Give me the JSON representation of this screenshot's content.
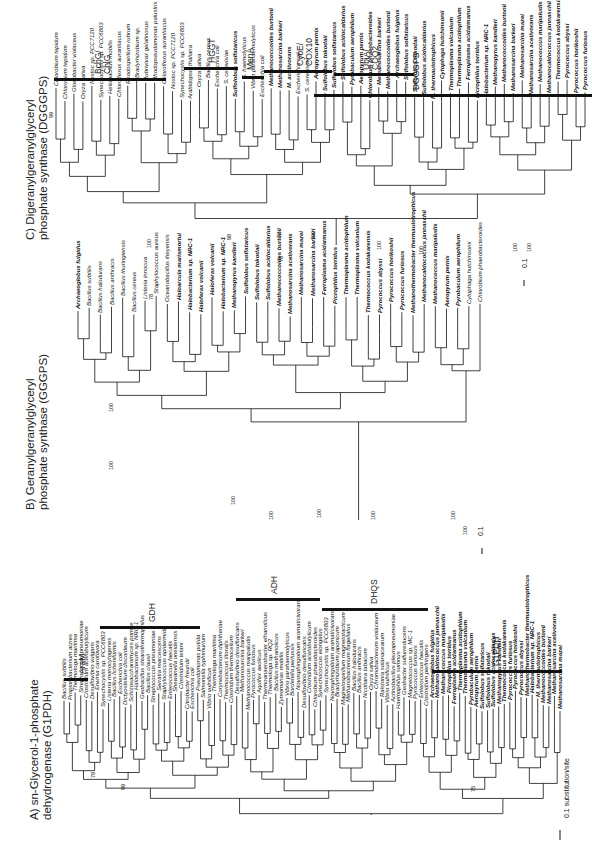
{
  "panels": {
    "a": {
      "title_line1": "A) sn-Glycerol-1-phosphate",
      "title_line2": "dehydrogenase (G1PDH)",
      "groups": [
        "AraM",
        "GDH",
        "ADH",
        "DHQS",
        "G1PDH"
      ],
      "scale": "0.1 substitution/site",
      "bootstrap": [
        "78",
        "99",
        "75"
      ],
      "taxa_arar": [
        "Bacillus subtilis",
        "Propionibacterium acnes",
        "Thermotoga maritima",
        "Streptococcus pneumoniae",
        "Clostridium acetobutylicum",
        "Desulfovibrio vulgaris"
      ],
      "taxa_gdh": [
        "Erwinia carotovora",
        "Synechocystis sp. PCC6803",
        "Listeria monocytogenes",
        "Bacillus licheniformis",
        "Escherichia coli",
        "Dictyostelium discoideum",
        "Schizosaccharomyces pombe",
        "Halobacterium sp. NRC-1",
        "Geobacillus stearothermophilus",
        "Bacillus clausii",
        "Streptococcus pneumoniae",
        "Serratia marcescens",
        "Staphylococcus epidermidis",
        "Enterococcus faecalis",
        "Shewanella oneidensis",
        "Clostridium tetani",
        "Citrobacter freundii",
        "Escherichia coli",
        "Pseudomonas putida",
        "Salmonella typhimurium",
        "Vibrio vulnificus"
      ],
      "taxa_adh": [
        "Thermotoga maritima",
        "Corynebacterium diphtheriae",
        "Thermococcus litoralis",
        "Clostridium thermocellum",
        "Desulfovibrio desulfuricans",
        "Methanosarcina barkeri",
        "Methanococcus maripaludis",
        "Pyrococcus furiosus",
        "Aquifex aeolicus",
        "Thermoanaerobacter ethanolicus",
        "Thermotoga sp. RQ2",
        "Bacillus methanolicus",
        "Zymomonas mobilis",
        "Vibrio parahaemolyticus",
        "Bordetella pertussis",
        "Novosphingobium aromaticivorans",
        "Desulfovibrio desulfuricans",
        "Clostridium acetobutylicum"
      ],
      "taxa_dhqs": [
        "Chlorobium phaeobacteroides",
        "Synechococcus elongatus",
        "Synechocystis sp. PCC6803",
        "Novosphingobium aromaticivorans",
        "Bradyrhizobium japonicum",
        "Magnetospirillum magnetotacticum",
        "Methanobacterium flagellatus",
        "Bacillus halodurans",
        "Bacillus anthracis",
        "Nicotiana tabacum",
        "Oryza sativa",
        "Chromobacterium violaceum",
        "Ralstonia solanacearum",
        "Vibrio vulnificus",
        "Actinobacillus pleuropneumoniae",
        "Haemophilus somnus",
        "Geobacter sulfurreducens",
        "Magnetococcus sp. MC-1",
        "Pyrococcus furiosus",
        "Enterococcus faecalis",
        "Clostridium perfringens"
      ],
      "taxa_g1pdh": [
        "Archaeoglobus fulgidus",
        "Methanocaldococcus jannaschii",
        "Methanococcus maripaludis",
        "Picrophilus torridus",
        "Ferroplasma acidarmanus",
        "Thermoplasma acidophilum",
        "Thermoplasma volcanium",
        "Pyrobaculum aerophilum",
        "Aeropyrum pernix",
        "Sulfolobus solfataricus",
        "Sulfolobus tokodaii",
        "Sulfolobus acidocaldarius",
        "Methanopyrus kandleri",
        "Thermococcus kodakarensis",
        "Pyrococcus furiosus",
        "Pyrococcus horikoshii",
        "Pyrococcus abyssi",
        "Methanothermobacter thermautotrophicus",
        "Halobacterium sp. NRC-1",
        "M. thermautotrophicus",
        "Methanococcoides burtonii",
        "Methanosarcina barkeri",
        "Methanosarcina acetivorans",
        "Methanosarcina mazei"
      ]
    },
    "b": {
      "title_line1": "B) Geranylgeranylglyceryl",
      "title_line2": "phosphate synthase (GGGPS)",
      "scale": "0.1",
      "bootstrap": [
        "78",
        "100",
        "100",
        "100",
        "100",
        "100",
        "100",
        "100",
        "100"
      ],
      "taxa": [
        {
          "name": "Archaeoglobus fulgidus",
          "bold": true
        },
        {
          "name": "Bacillus subtilis",
          "bold": false
        },
        {
          "name": "Bacillus halodurans",
          "bold": false
        },
        {
          "name": "Bacillus anthracis",
          "bold": false
        },
        {
          "name": "Bacillus thuringiensis",
          "bold": false
        },
        {
          "name": "Bacillus cereus",
          "bold": false
        },
        {
          "name": "Listeria innocua",
          "bold": false
        },
        {
          "name": "Staphylococcus aureus",
          "bold": false
        },
        {
          "name": "Oceanobacillus iheyensis",
          "bold": false
        },
        {
          "name": "Haloarcula marismortui",
          "bold": true
        },
        {
          "name": "Halobacterium sp. NRC-1",
          "bold": true
        },
        {
          "name": "Haloferax volcanii",
          "bold": true
        },
        {
          "name": "Haloferax volcanii",
          "bold": true
        },
        {
          "name": "Halobacterium sp. NRC-1",
          "bold": true
        },
        {
          "name": "Methanopyrus kandleri",
          "bold": true
        },
        {
          "name": "Sulfolobus solfataricus",
          "bold": true
        },
        {
          "name": "Sulfolobus tokodaii",
          "bold": true
        },
        {
          "name": "Sulfolobus acidocaldarius",
          "bold": true
        },
        {
          "name": "Methanococcoides burtonii",
          "bold": true
        },
        {
          "name": "Methanosarcina acetivorans",
          "bold": true
        },
        {
          "name": "Methanosarcina mazei",
          "bold": true
        },
        {
          "name": "Methanosarcina barkeri",
          "bold": true
        },
        {
          "name": "Ferroplasma acidarmanus",
          "bold": true
        },
        {
          "name": "Picrophilus torridus",
          "bold": true
        },
        {
          "name": "Thermoplasma acidophilum",
          "bold": true
        },
        {
          "name": "Thermoplasma volcanium",
          "bold": true
        },
        {
          "name": "Thermococcus kodakarensis",
          "bold": true
        },
        {
          "name": "Pyrococcus abyssi",
          "bold": true
        },
        {
          "name": "Pyrococcus horikoshii",
          "bold": true
        },
        {
          "name": "Pyrococcus furiosus",
          "bold": true
        },
        {
          "name": "Methanothermobacter thermautotrophicus",
          "bold": true
        },
        {
          "name": "Methanocaldococcus jannaschii",
          "bold": true
        },
        {
          "name": "Methanococcus maripaludis",
          "bold": true
        },
        {
          "name": "Aeropyrum pernix",
          "bold": true
        },
        {
          "name": "Pyrobaculum aerophilum",
          "bold": true
        },
        {
          "name": "Cytophaga hutchinsonii",
          "bold": false
        },
        {
          "name": "Chlorobium phaeobacteroides",
          "bold": false
        }
      ]
    },
    "c": {
      "title_line1": "C) Digeranylgeranylglyceryl",
      "title_line2": "phosphate synthase (DGGGPS)",
      "groups": [
        "BchG/\nChlG",
        "HGGT",
        "MenA",
        "CyoE/\nCOX10",
        "UbiA/\nCOQ2",
        "DGGGPS"
      ],
      "scale": "0.1",
      "bootstrap": [
        "99",
        "100",
        "98",
        "72",
        "78",
        "100",
        "100",
        "100",
        "100",
        "100"
      ],
      "taxa": [
        {
          "name": "Chlorobium tepidum",
          "bold": false
        },
        {
          "name": "Chlorobium tepidum",
          "bold": false
        },
        {
          "name": "Gloeobacter violaceus",
          "bold": false
        },
        {
          "name": "Oryza sativa",
          "bold": false
        },
        {
          "name": "Nostoc sp. PCC7120",
          "bold": false
        },
        {
          "name": "Synechocystis sp. PCC6803",
          "bold": false
        },
        {
          "name": "Heliobacillus mobilis",
          "bold": false
        },
        {
          "name": "Chloroflexus aurantiacus",
          "bold": false
        },
        {
          "name": "Rhodospirillum rubrum",
          "bold": false
        },
        {
          "name": "Bradyrhizobium sp.",
          "bold": false
        },
        {
          "name": "Rubrivivax gelatinosus",
          "bold": false
        },
        {
          "name": "Rhodopseudomonas palustris",
          "bold": false
        },
        {
          "name": "Chloroflexus aurantiacus",
          "bold": false
        },
        {
          "name": "Nostoc sp. PCC7120",
          "bold": false
        },
        {
          "name": "Synechocystis sp. PCC6803",
          "bold": false
        },
        {
          "name": "Arabidopsis thaliana",
          "bold": false
        },
        {
          "name": "Oryza sativa",
          "bold": false
        },
        {
          "name": "Bacillus cereus",
          "bold": false
        },
        {
          "name": "Escherichia coli",
          "bold": false
        },
        {
          "name": "S. cerevisiae",
          "bold": false
        },
        {
          "name": "Sulfolobus solfataricus",
          "bold": true
        },
        {
          "name": "S. haemolyticus",
          "bold": false
        },
        {
          "name": "Vibrio parahaemolyticus",
          "bold": false
        },
        {
          "name": "Escherichia coli",
          "bold": false
        },
        {
          "name": "Methanococcoides burtonii",
          "bold": true
        },
        {
          "name": "Methanosarcina barkeri",
          "bold": true
        },
        {
          "name": "M. acetivorans",
          "bold": true
        },
        {
          "name": "Escherichia coli",
          "bold": false
        },
        {
          "name": "S. cerevisiae",
          "bold": false
        },
        {
          "name": "Aeropyrum pernix",
          "bold": true
        },
        {
          "name": "Sulfolobus tokodaii",
          "bold": true
        },
        {
          "name": "Sulfolobus solfataricus",
          "bold": true
        },
        {
          "name": "Sulfolobus acidocaldarius",
          "bold": true
        },
        {
          "name": "Pyrobaculum aerophilum",
          "bold": true
        },
        {
          "name": "Aeropyrum pernix",
          "bold": true
        },
        {
          "name": "Chlorobium phaeobacteroides",
          "bold": true
        },
        {
          "name": "Methanosarcina barkeri",
          "bold": true
        },
        {
          "name": "Methanococcoides burtonii",
          "bold": true
        },
        {
          "name": "Archaeoglobus fulgidus",
          "bold": true
        },
        {
          "name": "Sulfolobus solfataricus",
          "bold": true
        },
        {
          "name": "Sulfolobus tokodaii",
          "bold": true
        },
        {
          "name": "Sulfolobus acidocaldarius",
          "bold": true
        },
        {
          "name": "M. thermautotrophicus",
          "bold": true
        },
        {
          "name": "Cytophaga hutchinsonii",
          "bold": true
        },
        {
          "name": "Thermoplasma volcanium",
          "bold": true
        },
        {
          "name": "Thermoplasma acidophilum",
          "bold": true
        },
        {
          "name": "Ferroplasma acidarmanus",
          "bold": true
        },
        {
          "name": "Picrophilus torridus",
          "bold": true
        },
        {
          "name": "Halobacterium sp. NRC-1",
          "bold": true
        },
        {
          "name": "Methanopyrus kandleri",
          "bold": true
        },
        {
          "name": "Methanococcoides burtonii",
          "bold": true
        },
        {
          "name": "Methanosarcina barkeri",
          "bold": true
        },
        {
          "name": "Methanosarcina mazei",
          "bold": true
        },
        {
          "name": "Methanosarcina acetivorans",
          "bold": true
        },
        {
          "name": "Methanococcus maripaludis",
          "bold": true
        },
        {
          "name": "Methanocaldococcus jannaschii",
          "bold": true
        },
        {
          "name": "Thermococcus kodakarensis",
          "bold": true
        },
        {
          "name": "Pyrococcus abyssi",
          "bold": true
        },
        {
          "name": "Pyrococcus horikoshii",
          "bold": true
        },
        {
          "name": "Pyrococcus furiosus",
          "bold": true
        }
      ]
    }
  }
}
